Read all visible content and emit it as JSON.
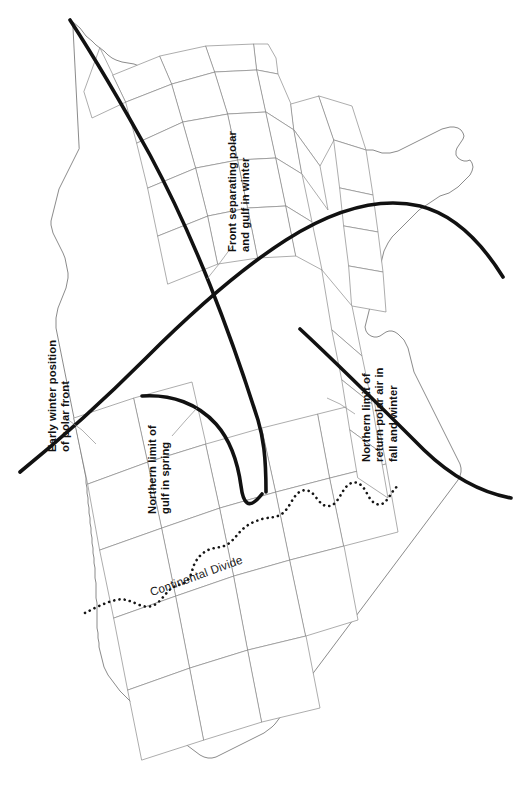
{
  "figure": {
    "type": "thematic-map",
    "region": "Contiguous United States",
    "orientation": "rotated 90 degrees clockwise (north at left)",
    "background_color": "#ffffff",
    "state_border_color": "#8a8a8a",
    "front_line_color": "#111111",
    "divide_line_color": "#151515"
  },
  "labels": {
    "front_polar_gulf_winter": "Front separating polar\nand gulf in winter",
    "early_winter_polar_front": "Early winter position\nof polar front",
    "northern_limit_gulf_spring": "Northern limit of\ngulf in spring",
    "northern_limit_return_polar": "Northern limit of\nreturn polar air in\nfall and winter",
    "continental_divide": "Continental Divide"
  },
  "legend_features": [
    {
      "name": "front-polar-gulf-winter",
      "style": "thick solid black curve",
      "label": "Front separating polar and gulf in winter"
    },
    {
      "name": "early-winter-polar-front",
      "style": "thick solid black curve",
      "label": "Early winter position of polar front"
    },
    {
      "name": "northern-limit-gulf-spring",
      "style": "thick solid black curve",
      "label": "Northern limit of gulf in spring"
    },
    {
      "name": "northern-limit-return-polar-air",
      "style": "thick solid black curve",
      "label": "Northern limit of return polar air in fall and winter"
    },
    {
      "name": "continental-divide",
      "style": "dotted black line",
      "label": "Continental Divide"
    }
  ]
}
